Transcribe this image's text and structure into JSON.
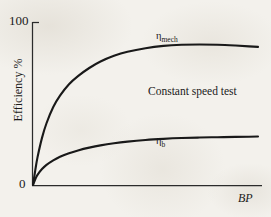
{
  "chart_data": {
    "type": "line",
    "title": "",
    "xlabel": "BP",
    "ylabel": "Efficiency %",
    "xlim": [
      0,
      100
    ],
    "ylim": [
      0,
      100
    ],
    "grid": false,
    "legend_position": "inline-curve-labels",
    "x_tick_labels": [],
    "y_tick_labels": [
      "0",
      "100"
    ],
    "y_ticks": [
      0,
      100
    ],
    "annotations": [
      {
        "text": "Constant speed test",
        "x": 52,
        "y": 56
      }
    ],
    "series": [
      {
        "name": "mechanical efficiency",
        "label_base": "η",
        "label_sub": "mech",
        "label_x": 57,
        "label_y": 95,
        "x": [
          0,
          1,
          2,
          4,
          6,
          9,
          12,
          16,
          20,
          25,
          30,
          36,
          42,
          50,
          58,
          66,
          74,
          82,
          90,
          96,
          100
        ],
        "y": [
          0,
          9,
          17,
          29,
          38,
          48,
          55,
          62,
          67,
          72,
          76,
          79.5,
          82,
          84.2,
          85.6,
          86.3,
          86.5,
          86.3,
          85.8,
          85.3,
          85.0
        ]
      },
      {
        "name": "brake thermal efficiency",
        "label_base": "η",
        "label_sub": "b",
        "label_x": 57,
        "label_y": 29,
        "x": [
          0,
          1,
          2,
          4,
          6,
          9,
          12,
          16,
          20,
          25,
          30,
          36,
          42,
          50,
          58,
          66,
          74,
          82,
          90,
          96,
          100
        ],
        "y": [
          0,
          3.5,
          6.2,
          9.8,
          12.4,
          15.2,
          17.4,
          19.6,
          21.3,
          23.0,
          24.4,
          25.7,
          26.7,
          27.7,
          28.4,
          28.9,
          29.2,
          29.4,
          29.6,
          29.7,
          29.8
        ]
      }
    ]
  },
  "axes": {
    "y_tick_top_label": "100",
    "y_tick_origin_label": "0",
    "y_title": "Efficiency %",
    "x_title": "BP"
  },
  "labels": {
    "eta_mech_base": "η",
    "eta_mech_sub": "mech",
    "eta_b_base": "η",
    "eta_b_sub": "b",
    "note": "Constant speed test"
  },
  "colors": {
    "paper": "#f3f1ec",
    "ink": "#191919",
    "axis": "#2b2b2b"
  }
}
